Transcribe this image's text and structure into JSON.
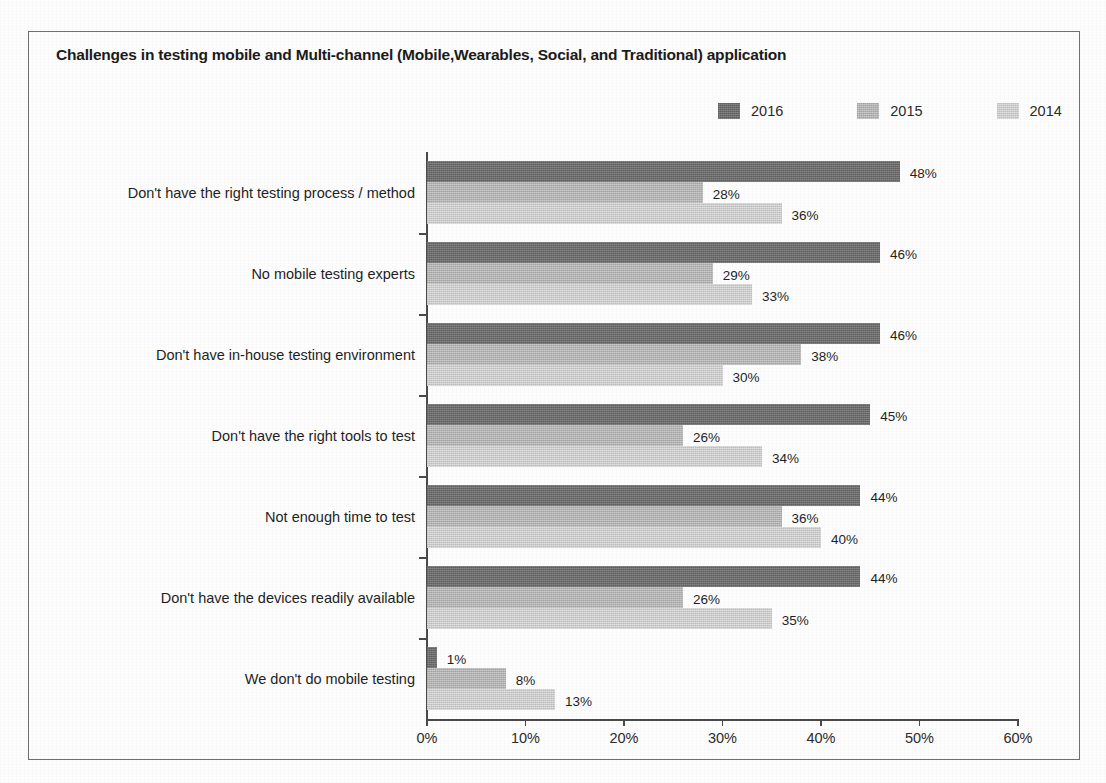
{
  "chart_data": {
    "type": "bar",
    "orientation": "horizontal",
    "title": "Challenges in testing mobile and Multi-channel (Mobile,Wearables, Social, and Traditional) application",
    "xlabel": "",
    "ylabel": "",
    "xlim": [
      0,
      60
    ],
    "xticks": [
      "0%",
      "10%",
      "20%",
      "30%",
      "40%",
      "50%",
      "60%"
    ],
    "xtick_values": [
      0,
      10,
      20,
      30,
      40,
      50,
      60
    ],
    "grid": false,
    "legend_position": "top-right",
    "categories": [
      "Don't have the right testing process / method",
      "No mobile testing experts",
      "Don't have in-house testing environment",
      "Don't have the right tools to test",
      "Not enough time to test",
      "Don't have the devices readily available",
      "We don't do mobile testing"
    ],
    "series": [
      {
        "name": "2016",
        "color": "#6d6d6d",
        "values": [
          48,
          46,
          46,
          45,
          44,
          44,
          1
        ],
        "labels": [
          "48%",
          "46%",
          "46%",
          "45%",
          "44%",
          "44%",
          "1%"
        ]
      },
      {
        "name": "2015",
        "color": "#b4b4b4",
        "values": [
          28,
          29,
          38,
          26,
          36,
          26,
          8
        ],
        "labels": [
          "28%",
          "29%",
          "38%",
          "26%",
          "36%",
          "26%",
          "8%"
        ]
      },
      {
        "name": "2014",
        "color": "#cdcdcd",
        "values": [
          36,
          33,
          30,
          34,
          40,
          35,
          13
        ],
        "labels": [
          "36%",
          "33%",
          "30%",
          "34%",
          "40%",
          "35%",
          "13%"
        ]
      }
    ]
  },
  "colors": {
    "frame_border": "#6f6f6f",
    "axis": "#4a4a4a",
    "text": "#1f1f1f",
    "background": "#fdfdfd"
  }
}
